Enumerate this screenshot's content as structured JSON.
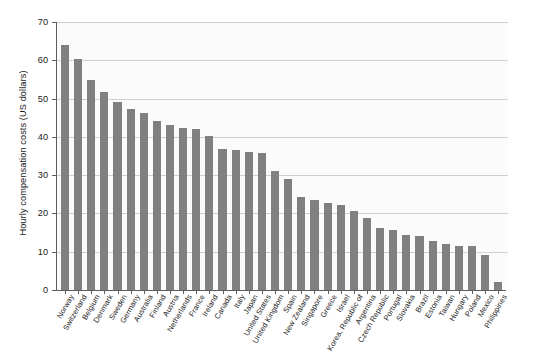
{
  "chart_data": {
    "type": "bar",
    "title": "",
    "xlabel": "",
    "ylabel": "Hourly compensation costs (US dollars)",
    "ylim": [
      0,
      70
    ],
    "yticks": [
      0,
      10,
      20,
      30,
      40,
      50,
      60,
      70
    ],
    "grid": true,
    "legend": false,
    "bar_color": "#808080",
    "plot_background": "#fbfbfb",
    "categories": [
      "Norway",
      "Switzerland",
      "Belgium",
      "Denmark",
      "Sweden",
      "Germany",
      "Australia",
      "Finland",
      "Austria",
      "Netherlands",
      "France",
      "Ireland",
      "Canada",
      "Italy",
      "Japan",
      "United States",
      "United Kingdom",
      "Spain",
      "New Zealand",
      "Singapore",
      "Greece",
      "Israel",
      "Korea, Republic of",
      "Argentina",
      "Czech Republic",
      "Portugal",
      "Slovakia",
      "Brazil",
      "Estonia",
      "Taiwan",
      "Hungary",
      "Poland",
      "Mexico",
      "Philippines"
    ],
    "values": [
      64.1,
      60.4,
      54.8,
      51.6,
      49.1,
      47.4,
      46.3,
      44.1,
      43.2,
      42.3,
      42.1,
      40.1,
      36.9,
      36.5,
      36.0,
      35.8,
      31.2,
      28.9,
      24.2,
      23.6,
      22.6,
      22.3,
      20.7,
      18.9,
      16.1,
      15.8,
      14.4,
      14.1,
      12.9,
      11.9,
      11.6,
      11.5,
      9.1,
      2.1
    ]
  }
}
